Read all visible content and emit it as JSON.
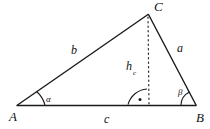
{
  "figure": {
    "background_color": "#ffffff",
    "stroke_color": "#1a1a1a",
    "vertices": {
      "A": {
        "label": "A",
        "x": 17,
        "y": 106
      },
      "B": {
        "label": "B",
        "x": 196,
        "y": 106
      },
      "C": {
        "label": "C",
        "x": 148,
        "y": 14
      }
    },
    "vertex_labels": [
      {
        "name": "vertex-label-A",
        "text": "A",
        "x": 9,
        "y": 110
      },
      {
        "name": "vertex-label-B",
        "text": "B",
        "x": 196,
        "y": 111
      },
      {
        "name": "vertex-label-C",
        "text": "C",
        "x": 154,
        "y": 0
      }
    ],
    "side_labels": [
      {
        "name": "side-label-b",
        "text": "b",
        "x": 71,
        "y": 44
      },
      {
        "name": "side-label-a",
        "text": "a",
        "x": 177,
        "y": 42
      },
      {
        "name": "side-label-c",
        "text": "c",
        "x": 104,
        "y": 113
      }
    ],
    "altitude": {
      "label_text": "h",
      "label_subscript": "c",
      "label_x": 126,
      "label_y": 60,
      "foot_x": 149,
      "foot_y": 105,
      "apex_x": 148,
      "apex_y": 16,
      "style": "dotted"
    },
    "angles": [
      {
        "name": "angle-label-alpha",
        "text": "α",
        "x": 46,
        "y": 95,
        "vertex": "A"
      },
      {
        "name": "angle-label-beta",
        "text": "β",
        "x": 178,
        "y": 88,
        "vertex": "B"
      }
    ],
    "right_angle_marker": {
      "name": "right-angle-marker",
      "center_x": 149,
      "center_y": 105,
      "radius": 21,
      "dot_x": 140,
      "dot_y": 99
    }
  }
}
